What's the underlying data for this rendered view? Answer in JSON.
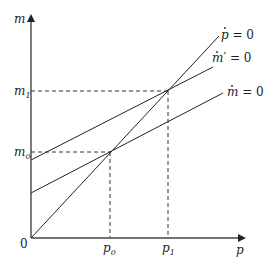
{
  "diagram": {
    "axes": {
      "x_label": "p",
      "y_label": "m",
      "origin_label": "0"
    },
    "ticks": {
      "x": [
        {
          "base": "p",
          "sub": "0"
        },
        {
          "base": "p",
          "sub": "1"
        }
      ],
      "y": [
        {
          "base": "m",
          "sub": "0"
        },
        {
          "base": "m",
          "sub": "1"
        }
      ]
    },
    "curves": [
      {
        "id": "p-dot",
        "label_base": "p",
        "label_rest": " = 0",
        "label_prime": ""
      },
      {
        "id": "m-dot-prime",
        "label_base": "m",
        "label_rest": " = 0",
        "label_prime": "′"
      },
      {
        "id": "m-dot",
        "label_base": "m",
        "label_rest": " = 0",
        "label_prime": ""
      }
    ],
    "equilibria": [
      {
        "name": "initial",
        "x": "p0",
        "y": "m0"
      },
      {
        "name": "new",
        "x": "p1",
        "y": "m1"
      }
    ]
  }
}
